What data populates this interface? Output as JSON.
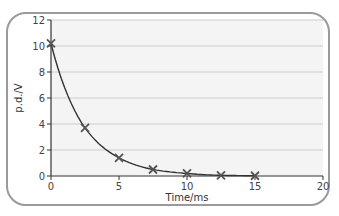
{
  "chart_data": {
    "type": "line",
    "title": "",
    "xlabel": "Time/ms",
    "ylabel": "p.d./V",
    "xlim": [
      0,
      20
    ],
    "ylim": [
      0,
      12
    ],
    "x_ticks": [
      0,
      5,
      10,
      15,
      20
    ],
    "y_ticks": [
      0,
      2,
      4,
      6,
      8,
      10,
      12
    ],
    "grid": true,
    "legend": null,
    "series": [
      {
        "name": "p.d. decay",
        "marker": "x",
        "smooth": true,
        "x": [
          0,
          2.5,
          5,
          7.5,
          10,
          12.5,
          15
        ],
        "y": [
          10.2,
          3.7,
          1.4,
          0.5,
          0.2,
          0.05,
          0.02
        ]
      }
    ]
  },
  "colors": {
    "line": "#333333",
    "grid": "#cccccc",
    "plot_bg": "#f4f4f4",
    "frame": "#9a9a9a"
  }
}
